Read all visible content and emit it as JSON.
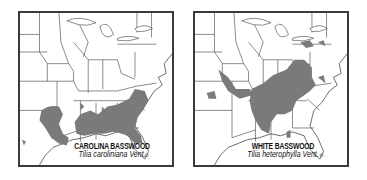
{
  "maps": [
    {
      "common_name": "CAROLINA BASSWOOD",
      "scientific_name": "Tilia caroliniana Vent.",
      "range_color": "#7a7a7a",
      "region": "Southeastern United States"
    },
    {
      "common_name": "WHITE BASSWOOD",
      "scientific_name": "Tilia heterophylla Vent.",
      "range_color": "#7a7a7a",
      "region": "Eastern United States (Appalachian region)"
    }
  ],
  "frame_color": "#3a3a3a"
}
